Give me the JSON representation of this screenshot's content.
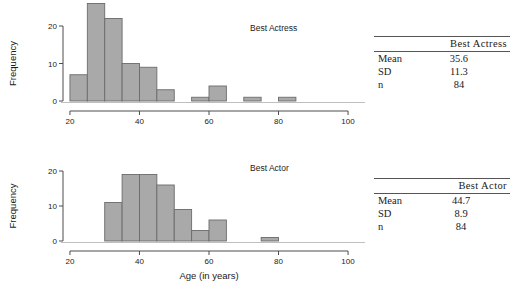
{
  "figure": {
    "background": "#ffffff",
    "bar_fill": "#a9a9a9",
    "bar_stroke": "#6b6b6b",
    "axis_color": "#4d4d4d"
  },
  "chart_data": [
    {
      "type": "bar",
      "name": "best-actress-histogram",
      "title": "Best Actress",
      "xlabel": "",
      "ylabel": "Frequency",
      "xlim": [
        18,
        102
      ],
      "ylim": [
        0,
        27
      ],
      "xticks": [
        20,
        40,
        60,
        80,
        100
      ],
      "xtick_labels": [
        "20",
        "40",
        "60",
        "80",
        "100"
      ],
      "yticks": [
        0,
        10,
        20
      ],
      "ytick_labels": [
        "0",
        "10",
        "20"
      ],
      "grid": false,
      "legend": "none",
      "bin_width": 5,
      "bins": [
        {
          "start": 20,
          "end": 25,
          "value": 7
        },
        {
          "start": 25,
          "end": 30,
          "value": 26
        },
        {
          "start": 30,
          "end": 35,
          "value": 22
        },
        {
          "start": 35,
          "end": 40,
          "value": 10
        },
        {
          "start": 40,
          "end": 45,
          "value": 9
        },
        {
          "start": 45,
          "end": 50,
          "value": 3
        },
        {
          "start": 55,
          "end": 60,
          "value": 1
        },
        {
          "start": 60,
          "end": 65,
          "value": 4
        },
        {
          "start": 70,
          "end": 75,
          "value": 1
        },
        {
          "start": 80,
          "end": 85,
          "value": 1
        }
      ]
    },
    {
      "type": "bar",
      "name": "best-actor-histogram",
      "title": "Best Actor",
      "xlabel": "Age (in years)",
      "ylabel": "Frequency",
      "xlim": [
        18,
        102
      ],
      "ylim": [
        0,
        21
      ],
      "xticks": [
        20,
        40,
        60,
        80,
        100
      ],
      "xtick_labels": [
        "20",
        "40",
        "60",
        "80",
        "100"
      ],
      "yticks": [
        0,
        10,
        20
      ],
      "ytick_labels": [
        "0",
        "10",
        "20"
      ],
      "grid": false,
      "legend": "none",
      "bin_width": 5,
      "bins": [
        {
          "start": 30,
          "end": 35,
          "value": 11
        },
        {
          "start": 35,
          "end": 40,
          "value": 19
        },
        {
          "start": 40,
          "end": 45,
          "value": 19
        },
        {
          "start": 45,
          "end": 50,
          "value": 16
        },
        {
          "start": 50,
          "end": 55,
          "value": 9
        },
        {
          "start": 55,
          "end": 60,
          "value": 3
        },
        {
          "start": 60,
          "end": 65,
          "value": 6
        },
        {
          "start": 75,
          "end": 80,
          "value": 1
        }
      ]
    }
  ],
  "tables": {
    "actress": {
      "corner": "",
      "header": "Best Actress",
      "rows": [
        {
          "label": "Mean",
          "value": "35.6"
        },
        {
          "label": "SD",
          "value": "11.3"
        },
        {
          "label": "n",
          "value": "84"
        }
      ]
    },
    "actor": {
      "corner": "",
      "header": "Best Actor",
      "rows": [
        {
          "label": "Mean",
          "value": "44.7"
        },
        {
          "label": "SD",
          "value": "8.9"
        },
        {
          "label": "n",
          "value": "84"
        }
      ]
    }
  }
}
